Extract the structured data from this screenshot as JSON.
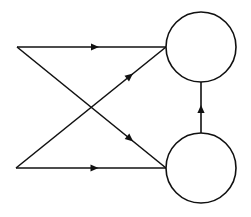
{
  "diagram": {
    "type": "directed-graph",
    "width": 251,
    "height": 217,
    "stroke_color": "#111111",
    "fill_color": "#ffffff",
    "stroke_width": 1.6,
    "nodes": [
      {
        "id": "input-top",
        "kind": "point",
        "x": 17,
        "y": 47
      },
      {
        "id": "input-bottom",
        "kind": "point",
        "x": 16,
        "y": 168
      },
      {
        "id": "node-top",
        "kind": "circle",
        "cx": 201,
        "cy": 47,
        "r": 35
      },
      {
        "id": "node-bottom",
        "kind": "circle",
        "cx": 201,
        "cy": 168,
        "r": 35
      }
    ],
    "edges": [
      {
        "id": "edge-top-to-top",
        "from": "input-top",
        "to": "node-top",
        "x1": 17,
        "y1": 47,
        "x2": 166,
        "y2": 47,
        "arrow_at": 0.55
      },
      {
        "id": "edge-top-to-bottom",
        "from": "input-top",
        "to": "node-bottom",
        "x1": 17,
        "y1": 47,
        "x2": 166,
        "y2": 168,
        "arrow_at": 0.78
      },
      {
        "id": "edge-bottom-to-top",
        "from": "input-bottom",
        "to": "node-top",
        "x1": 16,
        "y1": 168,
        "x2": 166,
        "y2": 47,
        "arrow_at": 0.78
      },
      {
        "id": "edge-bottom-to-bottom",
        "from": "input-bottom",
        "to": "node-bottom",
        "x1": 16,
        "y1": 168,
        "x2": 166,
        "y2": 168,
        "arrow_at": 0.55
      },
      {
        "id": "edge-bottom-node-to-top-node",
        "from": "node-bottom",
        "to": "node-top",
        "x1": 201,
        "y1": 133,
        "x2": 201,
        "y2": 82,
        "arrow_at": 0.55
      }
    ]
  }
}
